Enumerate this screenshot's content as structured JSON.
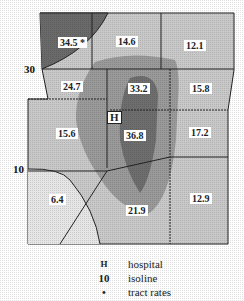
{
  "map": {
    "tracts": [
      {
        "id": "nw",
        "rate": "34.5 *"
      },
      {
        "id": "n",
        "rate": "14.6"
      },
      {
        "id": "ne",
        "rate": "12.1"
      },
      {
        "id": "w1",
        "rate": "24.7"
      },
      {
        "id": "c1",
        "rate": "33.2"
      },
      {
        "id": "e1",
        "rate": "15.8"
      },
      {
        "id": "w2",
        "rate": "15.6"
      },
      {
        "id": "c2",
        "rate": "36.8"
      },
      {
        "id": "e2",
        "rate": "17.2"
      },
      {
        "id": "sw",
        "rate": "6.4"
      },
      {
        "id": "s",
        "rate": "21.9"
      },
      {
        "id": "se",
        "rate": "12.9"
      }
    ],
    "hospital_marker": "H",
    "isolines": [
      {
        "value": "30"
      },
      {
        "value": "10"
      }
    ],
    "colors": {
      "light": "#e4e4e4",
      "mid_light": "#c8c8c8",
      "mid": "#a9a9a9",
      "mid_dark": "#8a8a8a",
      "dark": "#666666"
    }
  },
  "legend": [
    {
      "symbol": "H",
      "label": "hospital"
    },
    {
      "symbol": "10",
      "label": "isoline"
    },
    {
      "symbol": "•",
      "label": "tract rates"
    }
  ]
}
